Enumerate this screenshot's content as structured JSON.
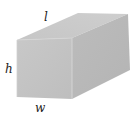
{
  "figure": {
    "type": "rectangular-prism",
    "labels": {
      "length": "l",
      "height": "h",
      "width": "w"
    },
    "colors": {
      "front_face": "#c4c4c4",
      "top_face": "#cbcbcb",
      "side_face": "#b9b9b9",
      "edge_highlight": "#d6d6d6",
      "label_text": "#222222",
      "background": "#ffffff"
    },
    "vertices": {
      "front_top_left": [
        17,
        40
      ],
      "front_top_right": [
        72,
        38
      ],
      "front_bottom_right": [
        72,
        99
      ],
      "front_bottom_left": [
        17,
        97
      ],
      "back_top_left": [
        78,
        13
      ],
      "back_top_right": [
        128,
        14
      ],
      "back_bottom_right": [
        130,
        70
      ]
    }
  }
}
